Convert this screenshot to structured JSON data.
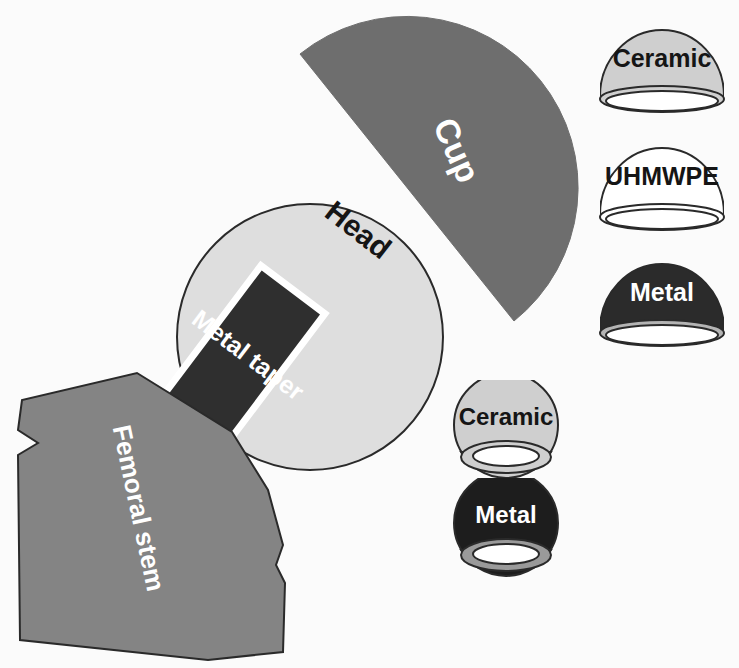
{
  "figure": {
    "background_color": "#fbfbfb"
  },
  "assembly": {
    "cup": {
      "label": "Cup",
      "fill": "#6e6e6e",
      "text_color": "#ffffff",
      "shape": "semicircle",
      "rotation_deg": -38
    },
    "head": {
      "label": "Head",
      "fill": "#dedede",
      "text_color": "#151515",
      "shape": "circle",
      "rotation_deg": -38
    },
    "metal_taper": {
      "label": "Metal taper",
      "fill": "#2f2f2f",
      "text_color": "#ffffff",
      "shape": "rectangle",
      "rotation_deg": -55
    },
    "femoral_stem": {
      "label": "Femoral stem",
      "fill": "#848484",
      "text_color": "#ffffff",
      "shape": "polygon",
      "rotation_deg": -78
    }
  },
  "cup_options": [
    {
      "label": "Ceramic",
      "fill": "#cfcfcf",
      "text_color": "#151515",
      "outline": "#2a2a2a"
    },
    {
      "label": "UHMWPE",
      "fill": "#ffffff",
      "text_color": "#151515",
      "outline": "#2a2a2a"
    },
    {
      "label": "Metal",
      "fill": "#2b2b2b",
      "text_color": "#ffffff",
      "outline": "#2a2a2a"
    }
  ],
  "ball_options": [
    {
      "label": "Ceramic",
      "fill": "#cfcfcf",
      "text_color": "#151515",
      "outline": "#2a2a2a"
    },
    {
      "label": "Metal",
      "fill": "#1d1d1d",
      "text_color": "#ffffff",
      "outline": "#2a2a2a"
    }
  ]
}
